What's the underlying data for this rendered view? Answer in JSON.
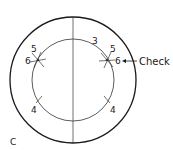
{
  "figure": {
    "panel_label": "C",
    "callout_label": "Check",
    "stroke_color": "#1a1a1a",
    "background": "#ffffff"
  },
  "outer_circle": {
    "cx": 73,
    "cy": 80,
    "r": 63
  },
  "inner_circle": {
    "cx": 73,
    "cy": 80,
    "r": 41
  },
  "diameter_line": {
    "x": 73,
    "y1": 17,
    "y2": 143
  },
  "arc_labels": {
    "top": "3",
    "upper_left_a": "5",
    "upper_left_b": "6",
    "upper_right_a": "5",
    "upper_right_b": "6",
    "lower_left": "4",
    "lower_right": "4"
  }
}
